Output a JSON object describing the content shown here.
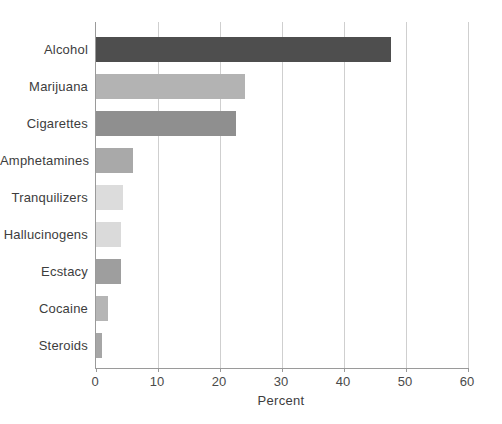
{
  "figure": {
    "background_color": "#ffffff"
  },
  "chart_data": {
    "type": "bar",
    "orientation": "horizontal",
    "title": "",
    "xlabel": "Percent",
    "ylabel": "",
    "categories": [
      "Alcohol",
      "Marijuana",
      "Cigarettes",
      "Amphetamines",
      "Tranquilizers",
      "Hallucinogens",
      "Ecstacy",
      "Cocaine",
      "Steroids"
    ],
    "values": [
      47.5,
      24,
      22.5,
      6,
      4.4,
      4,
      4,
      2,
      1
    ],
    "bar_colors": [
      "#4e4e4e",
      "#b3b3b3",
      "#8f8f8f",
      "#a9a9a9",
      "#dcdcdc",
      "#dadada",
      "#9e9e9e",
      "#b5b5b5",
      "#a6a6a6"
    ],
    "xlim": [
      0,
      60
    ],
    "x_ticks": [
      "0",
      "10",
      "20",
      "30",
      "40",
      "50",
      "60"
    ],
    "grid": "vertical",
    "legend": "none",
    "gridline_color": "#cfcfcf",
    "axis_color": "#9a9a9a",
    "label_color": "#3d3d3d"
  }
}
